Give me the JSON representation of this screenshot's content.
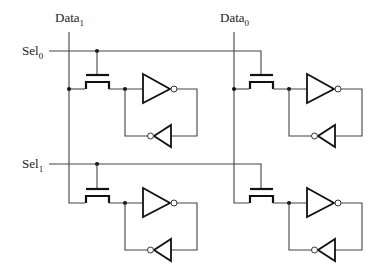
{
  "diagram": {
    "type": "circuit-schematic",
    "labels": {
      "data1": {
        "base": "Data",
        "sub": "1"
      },
      "data0": {
        "base": "Data",
        "sub": "0"
      },
      "sel0": {
        "base": "Sel",
        "sub": "0"
      },
      "sel1": {
        "base": "Sel",
        "sub": "1"
      }
    },
    "lines": {
      "bit_lines": [
        "Data1",
        "Data0"
      ],
      "word_lines": [
        "Sel0",
        "Sel1"
      ]
    },
    "cells": [
      {
        "row": "Sel0",
        "col": "Data1",
        "components": [
          "nmos-pass-transistor",
          "inverter",
          "feedback-inverter"
        ]
      },
      {
        "row": "Sel0",
        "col": "Data0",
        "components": [
          "nmos-pass-transistor",
          "inverter",
          "feedback-inverter"
        ]
      },
      {
        "row": "Sel1",
        "col": "Data1",
        "components": [
          "nmos-pass-transistor",
          "inverter",
          "feedback-inverter"
        ]
      },
      {
        "row": "Sel1",
        "col": "Data0",
        "components": [
          "nmos-pass-transistor",
          "inverter",
          "feedback-inverter"
        ]
      }
    ]
  }
}
